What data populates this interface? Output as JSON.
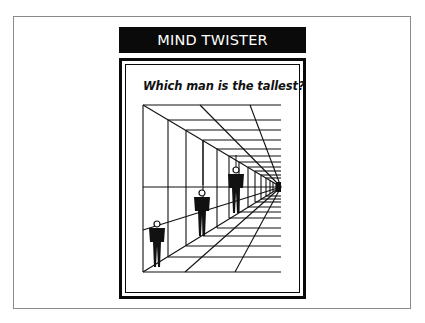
{
  "slide": {
    "title": "MIND TWISTER",
    "question": "Which man is the tallest?",
    "illustration": {
      "description": "Perspective corridor optical illusion with three identical figures",
      "figures": [
        {
          "label": "front-figure"
        },
        {
          "label": "middle-figure"
        },
        {
          "label": "back-figure"
        }
      ]
    },
    "colors": {
      "title_background": "#0a0a0a",
      "title_text": "#ffffff",
      "line": "#111111",
      "background": "#ffffff"
    }
  }
}
